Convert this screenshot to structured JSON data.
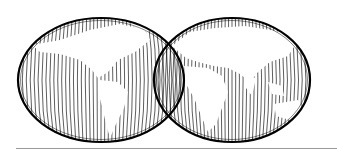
{
  "figure": {
    "hemispheres": [
      {
        "name": "western-hemisphere",
        "cx": 101,
        "cy": 80,
        "rx": 83,
        "ry": 62
      },
      {
        "name": "eastern-hemisphere",
        "cx": 232,
        "cy": 80,
        "rx": 78,
        "ry": 62
      }
    ],
    "line_color": "#000000",
    "land_color": "#ffffff",
    "rule_color": "#9a9a9a"
  }
}
